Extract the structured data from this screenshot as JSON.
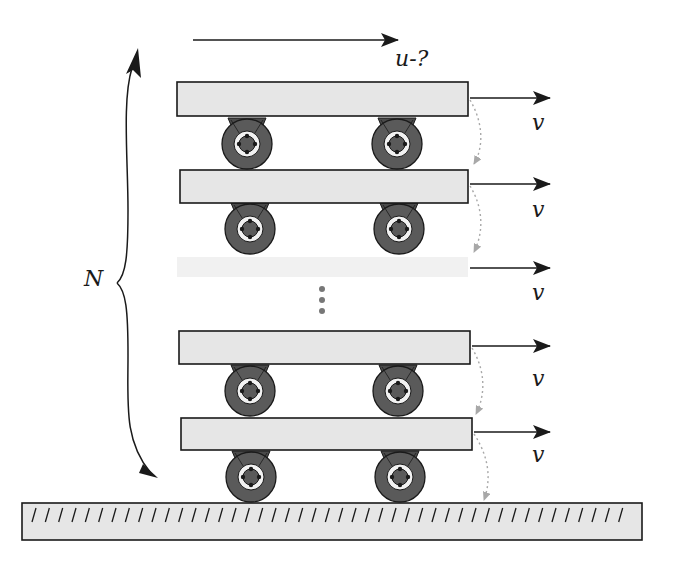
{
  "diagram": {
    "labels": {
      "top_velocity": "u-?",
      "cart_velocity": "v",
      "count": "N"
    },
    "carts": [
      {
        "id": 1,
        "plank": {
          "x": 177,
          "y": 82,
          "w": 291,
          "h": 34
        },
        "wheels_y": 144,
        "wheels_x": [
          247,
          397
        ],
        "velocity_label": "v",
        "arrow_y": 98,
        "label_y": 128,
        "faded": false
      },
      {
        "id": 2,
        "plank": {
          "x": 180,
          "y": 170,
          "w": 288,
          "h": 33
        },
        "wheels_y": 229,
        "wheels_x": [
          250,
          399
        ],
        "velocity_label": "v",
        "arrow_y": 184,
        "label_y": 216,
        "faded": false
      },
      {
        "id": 3,
        "plank": {
          "x": 177,
          "y": 256,
          "w": 291,
          "h": 22
        },
        "velocity_label": "v",
        "arrow_y": 268,
        "label_y": 298,
        "faded": true
      },
      {
        "id": 4,
        "plank": {
          "x": 179,
          "y": 331,
          "w": 291,
          "h": 33
        },
        "wheels_y": 391,
        "wheels_x": [
          250,
          398
        ],
        "velocity_label": "v",
        "arrow_y": 346,
        "label_y": 385,
        "faded": false
      },
      {
        "id": 5,
        "plank": {
          "x": 181,
          "y": 418,
          "w": 291,
          "h": 32
        },
        "wheels_y": 477,
        "wheels_x": [
          251,
          400
        ],
        "velocity_label": "v",
        "arrow_y": 432,
        "label_y": 462,
        "faded": false
      }
    ],
    "ellipsis_dots": 3,
    "ground": {
      "x": 22,
      "y": 503,
      "w": 620,
      "h": 37,
      "hatch_count": 45
    },
    "colors": {
      "plank_fill": "#e6e6e6",
      "outline": "#1a1a1a",
      "wheel_dark": "#5a5a5a",
      "wheel_light": "#f2f2f2",
      "dotted_arc": "#a8a8a8",
      "dots": "#777777"
    }
  }
}
